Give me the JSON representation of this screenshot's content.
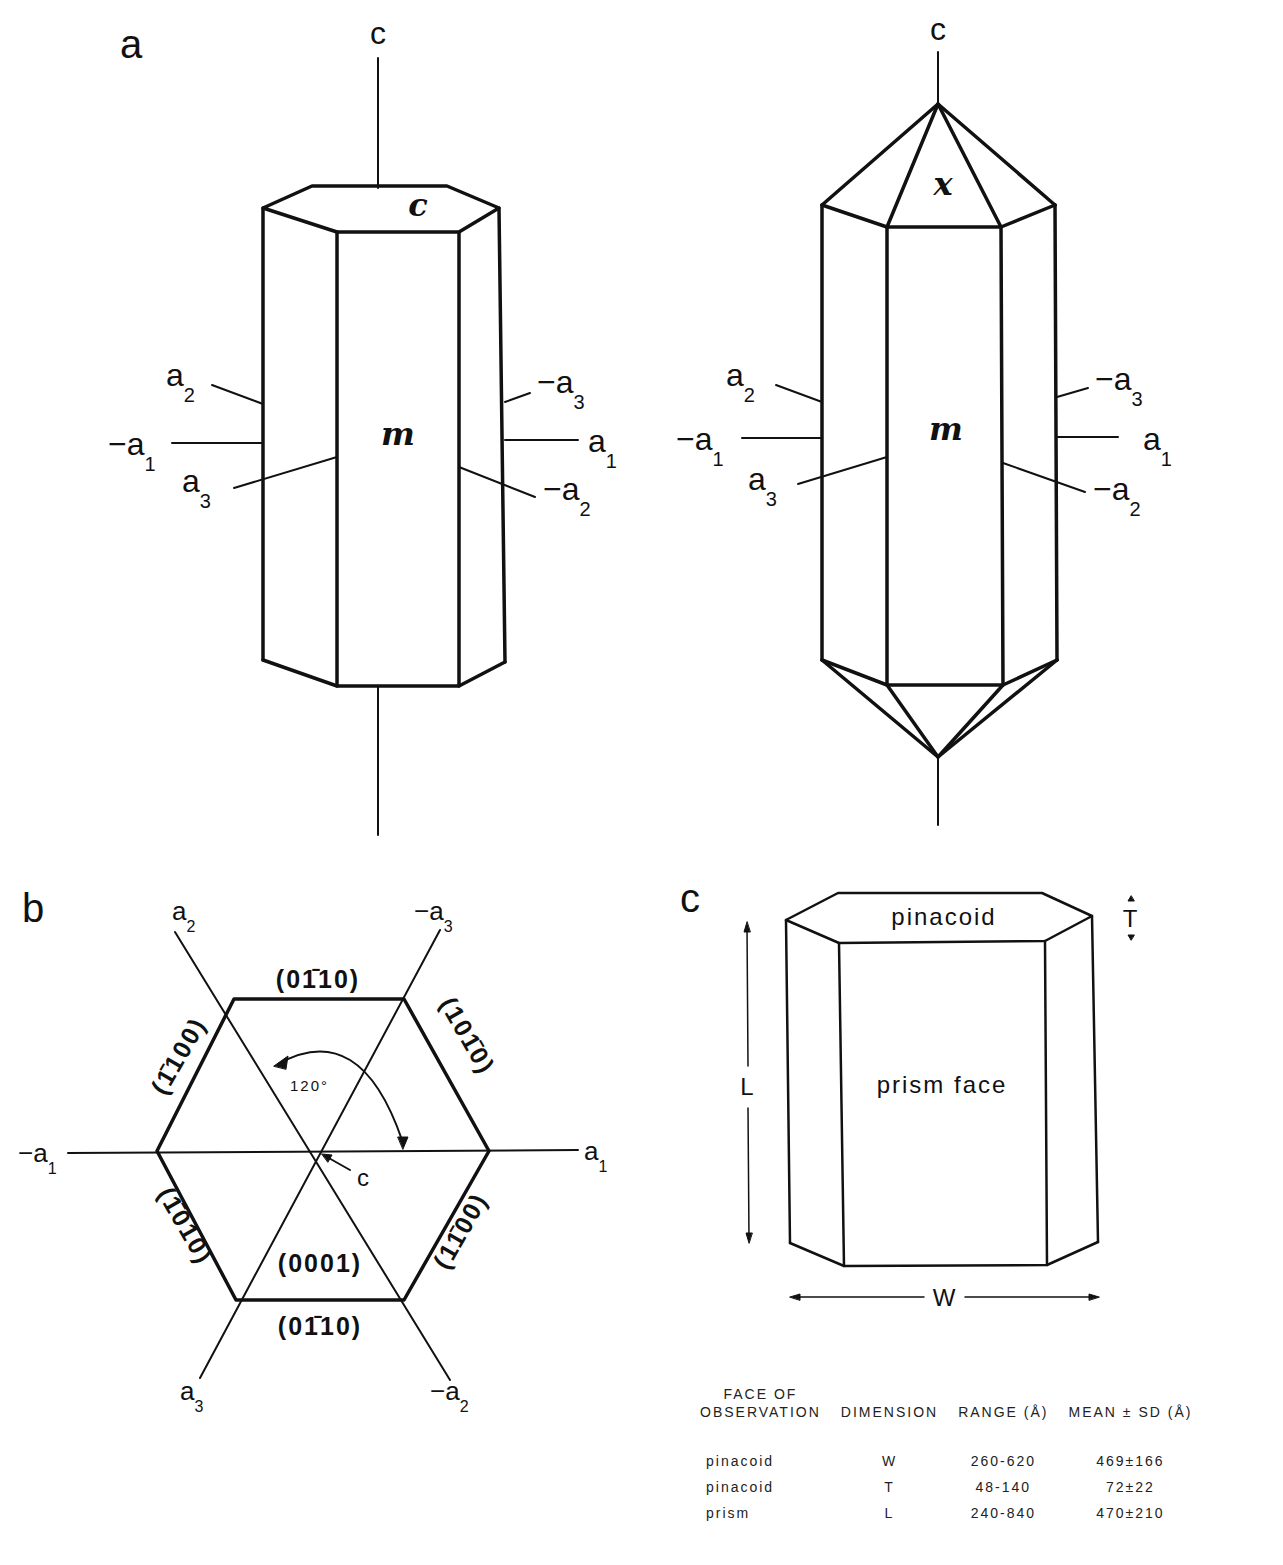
{
  "panels": {
    "a": {
      "label": "a",
      "left_crystal": {
        "c_axis_label": "c",
        "top_face_label": "c",
        "prism_face_label": "m",
        "axes_left": [
          {
            "sign": "",
            "base": "a",
            "sub": "2"
          },
          {
            "sign": "−",
            "base": "a",
            "sub": "1"
          },
          {
            "sign": "",
            "base": "a",
            "sub": "3"
          }
        ],
        "axes_right": [
          {
            "sign": "−",
            "base": "a",
            "sub": "3"
          },
          {
            "sign": "",
            "base": "a",
            "sub": "1"
          },
          {
            "sign": "−",
            "base": "a",
            "sub": "2"
          }
        ]
      },
      "right_crystal": {
        "c_axis_label": "c",
        "pyramid_face_label": "x",
        "prism_face_label": "m",
        "axes_left": [
          {
            "sign": "",
            "base": "a",
            "sub": "2"
          },
          {
            "sign": "−",
            "base": "a",
            "sub": "1"
          },
          {
            "sign": "",
            "base": "a",
            "sub": "3"
          }
        ],
        "axes_right": [
          {
            "sign": "−",
            "base": "a",
            "sub": "3"
          },
          {
            "sign": "",
            "base": "a",
            "sub": "1"
          },
          {
            "sign": "−",
            "base": "a",
            "sub": "2"
          }
        ]
      }
    },
    "b": {
      "label": "b",
      "axes": [
        {
          "sign": "",
          "base": "a",
          "sub": "2"
        },
        {
          "sign": "−",
          "base": "a",
          "sub": "3"
        },
        {
          "sign": "−",
          "base": "a",
          "sub": "1"
        },
        {
          "sign": "",
          "base": "a",
          "sub": "1"
        },
        {
          "sign": "",
          "base": "a",
          "sub": "3"
        },
        {
          "sign": "−",
          "base": "a",
          "sub": "2"
        }
      ],
      "faces": {
        "top": "(01̄1̄0)",
        "upper_right": "(101̄0)",
        "lower_right": "(11̄ 00)",
        "bottom": "(01̄10)",
        "lower_left": "(1̄010)",
        "upper_left": "(1̄100)",
        "center": "(0001)"
      },
      "faces_display": {
        "top": "(01̄10)",
        "upper_right": "(101̄0)",
        "lower_right": "(11̄00)",
        "bottom": "(01̄10)",
        "lower_left": "(1̄010)",
        "upper_left": "(1̄100)",
        "center": "(0001)"
      },
      "angle_label": "120°",
      "c_axis_label": "c"
    },
    "c": {
      "label": "c",
      "top_face_label": "pinacoid",
      "front_face_label": "prism face",
      "dim_length": "L",
      "dim_width": "W",
      "dim_thickness": "T"
    }
  },
  "table": {
    "headers": {
      "face_line1": "FACE OF",
      "face_line2": "OBSERVATION",
      "dimension": "DIMENSION",
      "range": "RANGE (Å)",
      "mean": "MEAN ± SD (Å)"
    },
    "rows": [
      {
        "face": "pinacoid",
        "dimension": "W",
        "range": "260-620",
        "mean": "469±166"
      },
      {
        "face": "pinacoid",
        "dimension": "T",
        "range": "48-140",
        "mean": "72±22"
      },
      {
        "face": "prism",
        "dimension": "L",
        "range": "240-840",
        "mean": "470±210"
      }
    ]
  }
}
